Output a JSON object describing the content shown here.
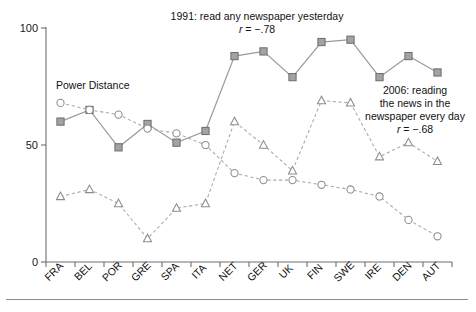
{
  "chart_data": {
    "type": "line",
    "title": "",
    "xlabel": "",
    "ylabel": "",
    "ylim": [
      0,
      100
    ],
    "yticks": [
      0,
      50,
      100
    ],
    "ytick_labels": [
      "0",
      "50",
      "100"
    ],
    "grid": false,
    "legend_position": "inline-annotations",
    "categories": [
      "FRA",
      "BEL",
      "POR",
      "GRE",
      "SPA",
      "ITA",
      "NET",
      "GER",
      "UK",
      "FIN",
      "SWE",
      "IRE",
      "DEN",
      "AUT"
    ],
    "series": [
      {
        "name": "1991: read any newspaper yesterday",
        "marker": "square",
        "line_style": "solid",
        "color": "#a3a3a3",
        "values": [
          60,
          65,
          49,
          59,
          51,
          56,
          88,
          90,
          79,
          94,
          95,
          79,
          88,
          81
        ]
      },
      {
        "name": "Power Distance",
        "marker": "circle",
        "line_style": "dashed",
        "color": "#8d8d8d",
        "values": [
          68,
          65,
          63,
          57,
          55,
          50,
          38,
          35,
          35,
          33,
          31,
          28,
          18,
          11
        ]
      },
      {
        "name": "2006: reading the news in the newspaper every day",
        "marker": "triangle",
        "line_style": "dashed",
        "color": "#8d8d8d",
        "values": [
          28,
          31,
          25,
          10,
          23,
          25,
          60,
          50,
          39,
          69,
          68,
          45,
          51,
          43
        ]
      }
    ],
    "annotations": [
      {
        "id": "annot-1991",
        "lines": [
          "1991: read any newspaper yesterday"
        ],
        "stat_symbol": "r",
        "stat_text": " = −.78"
      },
      {
        "id": "annot-2006",
        "lines": [
          "2006: reading",
          "the news in the",
          "newspaper every day"
        ],
        "stat_symbol": "r",
        "stat_text": " = −.68"
      },
      {
        "id": "annot-power",
        "lines": [
          "Power Distance"
        ],
        "stat_symbol": "",
        "stat_text": ""
      }
    ]
  },
  "annotations": {
    "title_1991": "1991: read any newspaper yesterday",
    "r_symbol_1991": "r",
    "r_value_1991": " = −.78",
    "title_2006_line1": "2006: reading",
    "title_2006_line2": "the news in the",
    "title_2006_line3": "newspaper every day",
    "r_symbol_2006": "r",
    "r_value_2006": " = −.68",
    "power_distance": "Power Distance"
  },
  "axis": {
    "y_tick_100": "100",
    "y_tick_50": "50",
    "y_tick_0": "0",
    "x_labels": [
      "FRA",
      "BEL",
      "POR",
      "GRE",
      "SPA",
      "ITA",
      "NET",
      "GER",
      "UK",
      "FIN",
      "SWE",
      "IRE",
      "DEN",
      "AUT"
    ]
  },
  "colors": {
    "axis": "#6e6e6e",
    "square_fill": "#a3a3a3",
    "square_stroke": "#6b6b6b",
    "open_marker_stroke": "#8d8d8d",
    "solid_line": "#9a9a9a",
    "dashed_line": "#a8a8a8",
    "text": "#111111",
    "background": "#ffffff"
  }
}
